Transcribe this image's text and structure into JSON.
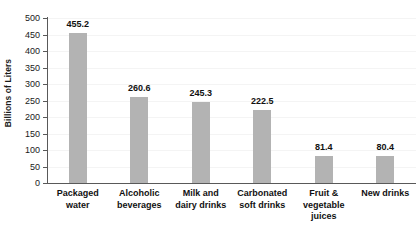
{
  "chart_data": {
    "type": "bar",
    "title": "",
    "subtitle": "",
    "xlabel": "",
    "ylabel": "Billions of Liters",
    "ylim": [
      0,
      500
    ],
    "ytick_step": 50,
    "yticks": [
      0,
      50,
      100,
      150,
      200,
      250,
      300,
      350,
      400,
      450,
      500
    ],
    "ytick_labels": [
      "0",
      "50",
      "100",
      "150",
      "200",
      "250",
      "300",
      "350",
      "400",
      "450",
      "500"
    ],
    "grid": true,
    "legend": false,
    "legend_position": "none",
    "bar_color": "#b3b3b3",
    "axis_color": "#595959",
    "grid_color": "#f4f4f4",
    "label_color": "#111111",
    "categories": [
      "Packaged\nwater",
      "Alcoholic\nbeverages",
      "Milk and\ndairy drinks",
      "Carbonated\nsoft drinks",
      "Fruit &\nvegetable\njuices",
      "New drinks"
    ],
    "values": [
      455.2,
      260.6,
      245.3,
      222.5,
      81.4,
      80.4
    ],
    "value_labels": [
      "455.2",
      "260.6",
      "245.3",
      "222.5",
      "81.4",
      "80.4"
    ]
  }
}
